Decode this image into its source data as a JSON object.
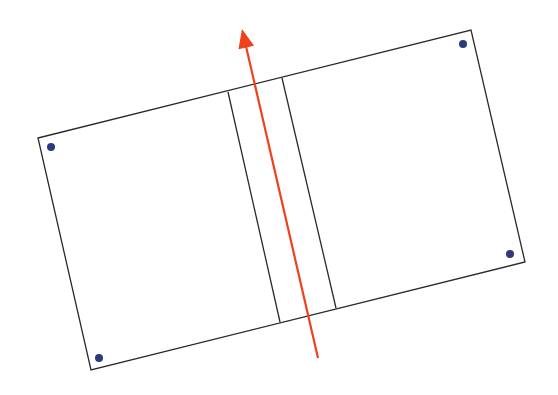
{
  "diagram": {
    "colors": {
      "outline": "#2a2a2a",
      "dot": "#2b3a7e",
      "arrow": "#f0401e",
      "background": "#ffffff"
    },
    "rectangle": {
      "corners": {
        "top_left": [
          38,
          138
        ],
        "top_right": [
          471,
          30
        ],
        "bottom_right": [
          525,
          262
        ],
        "bottom_left": [
          91,
          370
        ]
      }
    },
    "inner_lines": [
      {
        "top": [
          228,
          92
        ],
        "bottom": [
          280,
          322
        ]
      },
      {
        "top": [
          282,
          78
        ],
        "bottom": [
          336,
          308
        ]
      }
    ],
    "dots": [
      {
        "name": "top-left",
        "pos": [
          51,
          147
        ]
      },
      {
        "name": "top-right",
        "pos": [
          463,
          44
        ]
      },
      {
        "name": "bottom-right",
        "pos": [
          510,
          254
        ]
      },
      {
        "name": "bottom-left",
        "pos": [
          99,
          358
        ]
      }
    ],
    "arrow": {
      "start": [
        318,
        358
      ],
      "tip": [
        242,
        29
      ]
    }
  }
}
